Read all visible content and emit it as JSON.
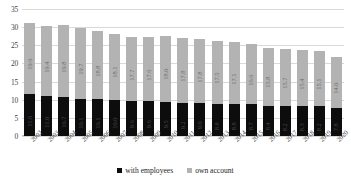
{
  "chart_data": {
    "type": "bar",
    "title": "",
    "xlabel": "",
    "ylabel": "",
    "ylim": [
      0,
      35
    ],
    "yticks": [
      0,
      5,
      10,
      15,
      20,
      25,
      30,
      35
    ],
    "grid": true,
    "stacked": true,
    "legend_position": "bottom-center",
    "categories": [
      "2002",
      "2003",
      "2004",
      "2005",
      "2006",
      "2007",
      "2008",
      "2009",
      "2010",
      "2011",
      "2012",
      "2013",
      "2014",
      "2015",
      "2016",
      "2017",
      "2018",
      "2019",
      "2020"
    ],
    "series": [
      {
        "name": "with employees",
        "color": "#0d0d0d",
        "values": [
          11.6,
          11.0,
          10.7,
          10.1,
          10.1,
          10.0,
          9.6,
          9.6,
          9.5,
          9.2,
          9.0,
          8.8,
          8.8,
          8.7,
          8.4,
          8.2,
          8.3,
          8.2,
          7.8
        ],
        "labels": [
          "11.6",
          "11.0",
          "10.7",
          "10.1",
          "10.1",
          "10.0",
          "9.6",
          "9.6",
          "9.5",
          "9.2",
          "9.0",
          "8.8",
          "8.8",
          "8.7",
          "8.4",
          "8.2",
          "8.3",
          "8.2",
          "7.8"
        ]
      },
      {
        "name": "own account",
        "color": "#b3b3b3",
        "values": [
          19.6,
          19.4,
          19.8,
          19.7,
          18.8,
          18.1,
          17.7,
          17.6,
          18.0,
          17.8,
          17.8,
          17.5,
          17.1,
          16.6,
          15.8,
          15.7,
          15.4,
          15.1,
          14.0
        ],
        "labels": [
          "19.6",
          "19.4",
          "19.8",
          "19.7",
          "18.8",
          "18.1",
          "17.7",
          "17.6",
          "18.0",
          "17.8",
          "17.8",
          "17.5",
          "17.1",
          "16.6",
          "15.8",
          "15.7",
          "15.4",
          "15.1",
          "14.0"
        ]
      }
    ],
    "totals": [
      31.2,
      30.4,
      30.5,
      29.8,
      28.9,
      28.1,
      27.3,
      27.2,
      27.5,
      27.0,
      26.8,
      26.3,
      25.9,
      25.3,
      24.2,
      23.9,
      23.7,
      23.3,
      21.8
    ]
  },
  "legend": {
    "items": [
      {
        "label": "with employees",
        "marker": "square-black"
      },
      {
        "label": "own account",
        "marker": "square-gray"
      }
    ]
  },
  "colors": {
    "with_employees": "#0d0d0d",
    "own_account": "#b3b3b3",
    "gridline": "#d9d9d9",
    "text": "#3f3f3f",
    "background": "#ffffff"
  }
}
